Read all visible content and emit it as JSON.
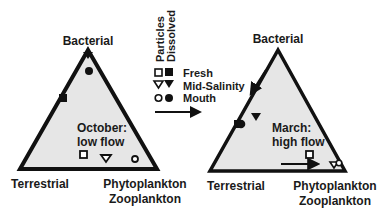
{
  "colors": {
    "ink": "#111111",
    "fill": "#e6e6e6",
    "background": "#ffffff"
  },
  "legend": {
    "column_headers": [
      "Particles",
      "Dissolved"
    ],
    "rows": [
      {
        "label": "Fresh",
        "particle_marker": "open-square",
        "dissolved_marker": "filled-square"
      },
      {
        "label": "Mid-Salinity",
        "particle_marker": "open-triangle-down",
        "dissolved_marker": "filled-triangle-down"
      },
      {
        "label": "Mouth",
        "particle_marker": "open-circle",
        "dissolved_marker": "filled-circle"
      }
    ],
    "arrow": "arrow-right"
  },
  "panels": [
    {
      "id": "october",
      "title_line1": "October:",
      "title_line2": "low flow",
      "vertices": {
        "top": "Bacterial",
        "bottom_left": "Terrestrial",
        "bottom_right_line1": "Phytoplankton",
        "bottom_right_line2": "Zooplankton"
      },
      "markers": [
        {
          "type": "filled-triangle-down",
          "series": "Mid-Salinity dissolved",
          "x": 88,
          "y": 54
        },
        {
          "type": "filled-circle",
          "series": "Mouth dissolved",
          "x": 89,
          "y": 71
        },
        {
          "type": "filled-square",
          "series": "Fresh dissolved",
          "x": 63,
          "y": 98
        },
        {
          "type": "open-square",
          "series": "Fresh particles",
          "x": 84,
          "y": 154
        },
        {
          "type": "open-triangle-down",
          "series": "Mid-Salinity particles",
          "x": 106,
          "y": 158
        },
        {
          "type": "open-circle",
          "series": "Mouth particles",
          "x": 135,
          "y": 158
        }
      ]
    },
    {
      "id": "march",
      "title_line1": "March:",
      "title_line2": "high flow",
      "vertices": {
        "top": "Bacterial",
        "bottom_left": "Terrestrial",
        "bottom_right_line1": "Phytoplankton",
        "bottom_right_line2": "Zooplankton"
      },
      "markers": [
        {
          "type": "filled-triangle-down",
          "series": "Mid-Salinity dissolved",
          "x": 256,
          "y": 116
        },
        {
          "type": "filled-circle",
          "series": "Mouth dissolved",
          "x": 241,
          "y": 124
        },
        {
          "type": "filled-square",
          "series": "Fresh dissolved",
          "x": 237,
          "y": 124
        },
        {
          "type": "open-square",
          "series": "Fresh particles",
          "x": 309,
          "y": 155
        },
        {
          "type": "open-triangle-down",
          "series": "Mid-Salinity particles",
          "x": 334,
          "y": 165
        },
        {
          "type": "open-circle",
          "series": "Mouth particles",
          "x": 339,
          "y": 163
        }
      ],
      "arrows": [
        {
          "direction": "down-left",
          "x1": 266,
          "y1": 70,
          "x2": 250,
          "y2": 94
        },
        {
          "direction": "right",
          "x1": 281,
          "y1": 164,
          "x2": 319,
          "y2": 164
        }
      ]
    }
  ]
}
